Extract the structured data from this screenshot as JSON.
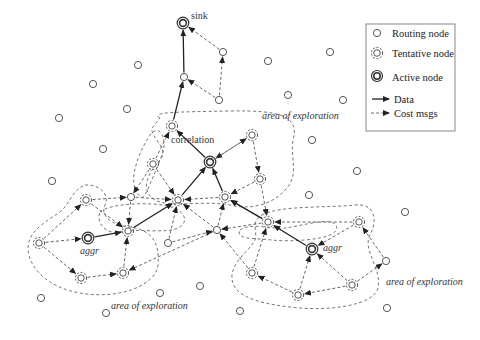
{
  "diagram": {
    "type": "sensor-network-routing",
    "legend": {
      "items": [
        {
          "key": "routing",
          "label": "Routing node",
          "symbol": "circle-icon"
        },
        {
          "key": "tentative",
          "label": "Tentative node",
          "symbol": "dashed-circle-icon"
        },
        {
          "key": "active",
          "label": "Active node",
          "symbol": "double-circle-icon"
        },
        {
          "key": "data",
          "label": "Data",
          "symbol": "solid-arrow-icon"
        },
        {
          "key": "cost",
          "label": "Cost msgs",
          "symbol": "dashed-arrow-icon"
        }
      ]
    },
    "labels": {
      "sink": "sink",
      "correlation": "correlation",
      "aggr_left": "aggr",
      "aggr_right": "aggr",
      "area_top": "area of exploration",
      "area_bottom_left": "area of exploration",
      "area_right": "area of exploration"
    },
    "nodes": [
      {
        "id": "sink",
        "type": "active",
        "label": "sink"
      },
      {
        "id": "corr",
        "type": "active",
        "label": "correlation"
      },
      {
        "id": "aggrL",
        "type": "active",
        "label": "aggr"
      },
      {
        "id": "aggrR",
        "type": "active",
        "label": "aggr"
      },
      {
        "id": "r1",
        "type": "routing"
      },
      {
        "id": "r2",
        "type": "routing"
      },
      {
        "id": "r3",
        "type": "routing"
      },
      {
        "id": "r4",
        "type": "routing"
      },
      {
        "id": "r5",
        "type": "routing"
      },
      {
        "id": "r6",
        "type": "routing"
      },
      {
        "id": "r7",
        "type": "routing"
      },
      {
        "id": "r8",
        "type": "routing"
      },
      {
        "id": "r9",
        "type": "routing"
      },
      {
        "id": "r10",
        "type": "routing"
      },
      {
        "id": "r11",
        "type": "routing"
      },
      {
        "id": "r12",
        "type": "routing"
      },
      {
        "id": "r13",
        "type": "routing"
      },
      {
        "id": "r14",
        "type": "routing"
      },
      {
        "id": "r15",
        "type": "routing"
      },
      {
        "id": "r16",
        "type": "routing"
      },
      {
        "id": "r17",
        "type": "routing"
      },
      {
        "id": "r18",
        "type": "routing"
      },
      {
        "id": "r19",
        "type": "routing"
      },
      {
        "id": "r20",
        "type": "routing"
      },
      {
        "id": "r21",
        "type": "routing"
      },
      {
        "id": "r22",
        "type": "routing"
      },
      {
        "id": "r23",
        "type": "routing"
      },
      {
        "id": "r24",
        "type": "routing"
      },
      {
        "id": "r25",
        "type": "routing"
      },
      {
        "id": "r26",
        "type": "routing"
      },
      {
        "id": "r27",
        "type": "routing"
      },
      {
        "id": "t1",
        "type": "tentative"
      },
      {
        "id": "t2",
        "type": "tentative"
      },
      {
        "id": "t3",
        "type": "tentative"
      },
      {
        "id": "t4",
        "type": "tentative"
      },
      {
        "id": "t5",
        "type": "tentative"
      },
      {
        "id": "t6",
        "type": "tentative"
      },
      {
        "id": "t7",
        "type": "tentative"
      },
      {
        "id": "t8",
        "type": "tentative"
      },
      {
        "id": "t9",
        "type": "tentative"
      },
      {
        "id": "t10",
        "type": "tentative"
      },
      {
        "id": "t11",
        "type": "tentative"
      },
      {
        "id": "t12",
        "type": "tentative"
      },
      {
        "id": "t13",
        "type": "tentative"
      },
      {
        "id": "t14",
        "type": "tentative"
      },
      {
        "id": "t15",
        "type": "tentative"
      },
      {
        "id": "t16",
        "type": "tentative"
      }
    ],
    "data_edges": [
      {
        "from": "r4",
        "to": "sink"
      },
      {
        "from": "t1",
        "to": "r4"
      },
      {
        "from": "corr",
        "to": "t1"
      },
      {
        "from": "t3",
        "to": "corr"
      },
      {
        "from": "t4",
        "to": "corr"
      },
      {
        "from": "t5",
        "to": "t3"
      },
      {
        "from": "aggrL",
        "to": "t5"
      },
      {
        "from": "t9",
        "to": "t4"
      },
      {
        "from": "aggrR",
        "to": "t9"
      }
    ],
    "cost_edges": [
      {
        "from": "r3",
        "to": "sink"
      },
      {
        "from": "r5",
        "to": "r3"
      },
      {
        "from": "r5",
        "to": "r4"
      },
      {
        "from": "t2",
        "to": "corr"
      },
      {
        "from": "corr",
        "to": "t2"
      },
      {
        "from": "t6",
        "to": "t5"
      },
      {
        "from": "t7",
        "to": "aggrL"
      },
      {
        "from": "t7",
        "to": "t6"
      },
      {
        "from": "t7",
        "to": "t8"
      },
      {
        "from": "t8",
        "to": "t12"
      },
      {
        "from": "t12",
        "to": "t5"
      },
      {
        "from": "t6",
        "to": "r17"
      },
      {
        "from": "r17",
        "to": "t3"
      },
      {
        "from": "r17",
        "to": "t5"
      },
      {
        "from": "t10",
        "to": "r17"
      },
      {
        "from": "t10",
        "to": "t3"
      },
      {
        "from": "t10",
        "to": "t1"
      },
      {
        "from": "t4",
        "to": "t3"
      },
      {
        "from": "t9",
        "to": "t4"
      },
      {
        "from": "t11",
        "to": "t4"
      },
      {
        "from": "t11",
        "to": "t9"
      },
      {
        "from": "t2",
        "to": "t11"
      },
      {
        "from": "r18",
        "to": "t12"
      },
      {
        "from": "r18",
        "to": "t3"
      },
      {
        "from": "r18",
        "to": "t4"
      },
      {
        "from": "r19",
        "to": "t3"
      },
      {
        "from": "r19",
        "to": "r18"
      },
      {
        "from": "t13",
        "to": "aggrR"
      },
      {
        "from": "t13",
        "to": "t9"
      },
      {
        "from": "r20",
        "to": "t13"
      },
      {
        "from": "t14",
        "to": "r20"
      },
      {
        "from": "t14",
        "to": "aggrR"
      },
      {
        "from": "t14",
        "to": "t15"
      },
      {
        "from": "t15",
        "to": "aggrR"
      },
      {
        "from": "t16",
        "to": "t9"
      },
      {
        "from": "t15",
        "to": "t16"
      },
      {
        "from": "t16",
        "to": "r18"
      },
      {
        "from": "t9",
        "to": "r18"
      }
    ]
  }
}
